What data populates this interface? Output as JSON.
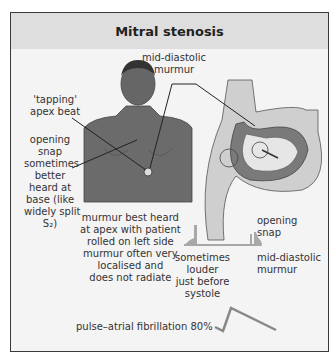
{
  "title": "Mitral stenosis",
  "labels": {
    "mid_diastolic_top": [
      "mid-diastolic",
      "murmur"
    ],
    "tapping_apex": [
      "'tapping'",
      "apex beat"
    ],
    "opening_snap_base": [
      "opening",
      "snap",
      "sometimes",
      "better",
      "heard at",
      "base (like",
      "widely split",
      "S₂)"
    ],
    "murmur_best_heard": [
      "murmur best heard",
      "at apex with patient",
      "rolled on left side",
      "murmur often very",
      "localised and",
      "does not radiate"
    ],
    "opening_snap_phono": [
      "opening",
      "snap"
    ],
    "sometimes_louder": [
      "sometimes",
      "louder",
      "just before",
      "systole"
    ],
    "mid_diastolic_phono": [
      "mid-diastolic",
      "murmur"
    ],
    "pulse": "pulse–atrial fibrillation 80%"
  },
  "colors": {
    "frame_border": "#3a3a3a",
    "header_bg": "#dedede",
    "body_bg": "#f4f4f4",
    "skin": "#6b6b6b",
    "heart_dark": "#7a7a7a",
    "heart_light": "#cfcfcf",
    "phono": "#a8a8a8"
  }
}
